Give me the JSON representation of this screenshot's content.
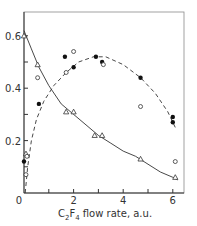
{
  "chart_data": {
    "type": "scatter",
    "title": "",
    "xlabel": "C2F4 flow rate, a.u.",
    "xlabel_parts": {
      "pre": "C",
      "sub1": "2",
      "mid": "F",
      "sub2": "4",
      "post": " flow rate, a.u."
    },
    "ylabel": "",
    "xlim": [
      0,
      6.4
    ],
    "ylim": [
      0,
      0.66
    ],
    "x_ticks": [
      0,
      1,
      2,
      3,
      4,
      5,
      6
    ],
    "x_tick_labels": [
      "0",
      "",
      "2",
      "",
      "4",
      "",
      "6"
    ],
    "y_ticks": [
      0,
      0.1,
      0.2,
      0.3,
      0.4,
      0.5,
      0.6
    ],
    "y_tick_labels": [
      "0",
      "",
      "0.2",
      "",
      "0.4",
      "",
      "0.6"
    ],
    "grid": false,
    "legend": null,
    "series": [
      {
        "name": "open-triangles",
        "marker": "triangle-open",
        "line": "solid",
        "points": [
          [
            0.0,
            0.6
          ],
          [
            0.55,
            0.49
          ],
          [
            1.7,
            0.31
          ],
          [
            2.0,
            0.31
          ],
          [
            2.85,
            0.22
          ],
          [
            3.15,
            0.22
          ],
          [
            4.7,
            0.13
          ],
          [
            6.1,
            0.06
          ],
          [
            0.08,
            0.15
          ]
        ],
        "fit": [
          [
            0.0,
            0.62
          ],
          [
            0.3,
            0.55
          ],
          [
            0.6,
            0.48
          ],
          [
            1.0,
            0.41
          ],
          [
            1.5,
            0.34
          ],
          [
            2.0,
            0.3
          ],
          [
            2.5,
            0.26
          ],
          [
            3.0,
            0.22
          ],
          [
            3.5,
            0.19
          ],
          [
            4.0,
            0.16
          ],
          [
            4.5,
            0.14
          ],
          [
            5.0,
            0.11
          ],
          [
            5.5,
            0.08
          ],
          [
            6.0,
            0.06
          ],
          [
            6.2,
            0.05
          ]
        ]
      },
      {
        "name": "filled-circles",
        "marker": "circle-filled",
        "line": "dashed",
        "points": [
          [
            0.0,
            0.12
          ],
          [
            0.6,
            0.34
          ],
          [
            1.65,
            0.52
          ],
          [
            2.0,
            0.48
          ],
          [
            2.9,
            0.52
          ],
          [
            3.15,
            0.5
          ],
          [
            4.7,
            0.44
          ],
          [
            6.0,
            0.29
          ],
          [
            6.0,
            0.27
          ]
        ],
        "fit": [
          [
            0.05,
            0.0
          ],
          [
            0.15,
            0.1
          ],
          [
            0.3,
            0.2
          ],
          [
            0.5,
            0.28
          ],
          [
            0.8,
            0.35
          ],
          [
            1.2,
            0.41
          ],
          [
            1.7,
            0.46
          ],
          [
            2.2,
            0.5
          ],
          [
            2.8,
            0.52
          ],
          [
            3.3,
            0.52
          ],
          [
            4.0,
            0.49
          ],
          [
            4.7,
            0.44
          ],
          [
            5.3,
            0.38
          ],
          [
            5.8,
            0.31
          ],
          [
            6.1,
            0.25
          ]
        ]
      },
      {
        "name": "open-circles",
        "marker": "circle-open",
        "line": "none",
        "points": [
          [
            0.55,
            0.44
          ],
          [
            1.7,
            0.46
          ],
          [
            2.0,
            0.54
          ],
          [
            3.2,
            0.49
          ],
          [
            4.7,
            0.33
          ],
          [
            6.1,
            0.12
          ],
          [
            0.12,
            0.14
          ],
          [
            0.08,
            0.07
          ]
        ]
      }
    ]
  }
}
